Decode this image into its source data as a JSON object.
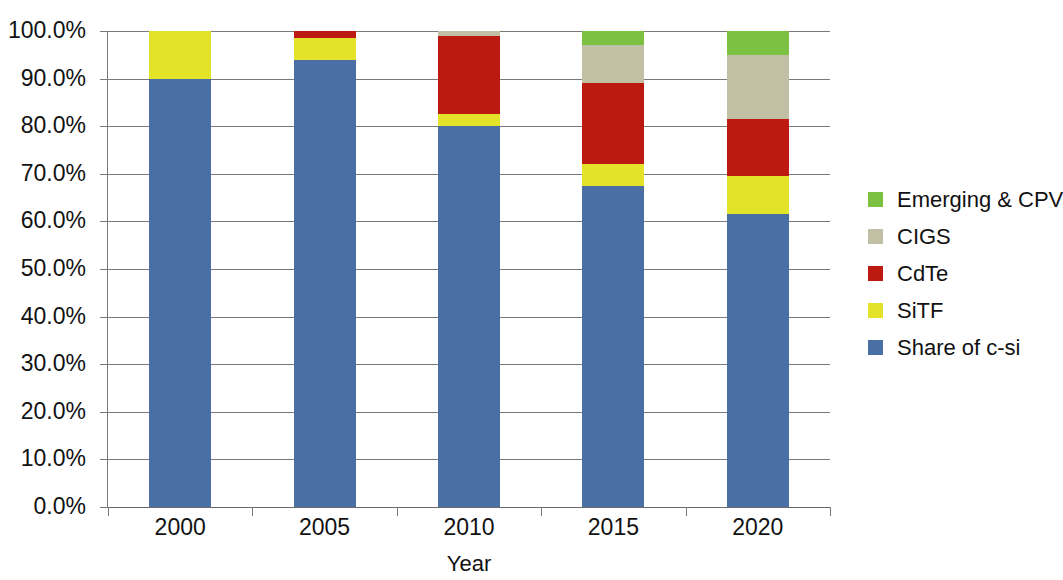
{
  "chart_data": {
    "type": "bar",
    "subtype": "stacked-100-percent",
    "title": "",
    "xlabel": "Year",
    "ylabel": "",
    "categories": [
      "2000",
      "2005",
      "2010",
      "2015",
      "2020"
    ],
    "ylim": [
      0,
      100
    ],
    "ytick_labels": [
      "0.0%",
      "10.0%",
      "20.0%",
      "30.0%",
      "40.0%",
      "50.0%",
      "60.0%",
      "70.0%",
      "80.0%",
      "90.0%",
      "100.0%"
    ],
    "ytick_values": [
      0,
      10,
      20,
      30,
      40,
      50,
      60,
      70,
      80,
      90,
      100
    ],
    "grid": true,
    "legend_position": "right",
    "stack_order_bottom_to_top": [
      "Share of c-si",
      "SiTF",
      "CdTe",
      "CIGS",
      "Emerging & CPV"
    ],
    "series": [
      {
        "name": "Share of c-si",
        "color": "#4a6fa5",
        "values": [
          90.0,
          94.0,
          80.0,
          67.5,
          61.5
        ]
      },
      {
        "name": "SiTF",
        "color": "#e3e32a",
        "values": [
          10.0,
          4.5,
          2.5,
          4.5,
          8.0
        ]
      },
      {
        "name": "CdTe",
        "color": "#bc1a10",
        "values": [
          0.0,
          1.5,
          16.5,
          17.0,
          12.0
        ]
      },
      {
        "name": "CIGS",
        "color": "#c2c0a4",
        "values": [
          0.0,
          0.0,
          1.0,
          8.0,
          13.5
        ]
      },
      {
        "name": "Emerging & CPV",
        "color": "#7cc142",
        "values": [
          0.0,
          0.0,
          0.0,
          3.0,
          5.0
        ]
      }
    ],
    "legend_entries_top_to_bottom": [
      {
        "label": "Emerging & CPV",
        "color": "#7cc142"
      },
      {
        "label": "CIGS",
        "color": "#c2c0a4"
      },
      {
        "label": "CdTe",
        "color": "#bc1a10"
      },
      {
        "label": "SiTF",
        "color": "#e3e32a"
      },
      {
        "label": "Share of c-si",
        "color": "#4a6fa5"
      }
    ]
  },
  "axes": {
    "x_title": "Year"
  }
}
